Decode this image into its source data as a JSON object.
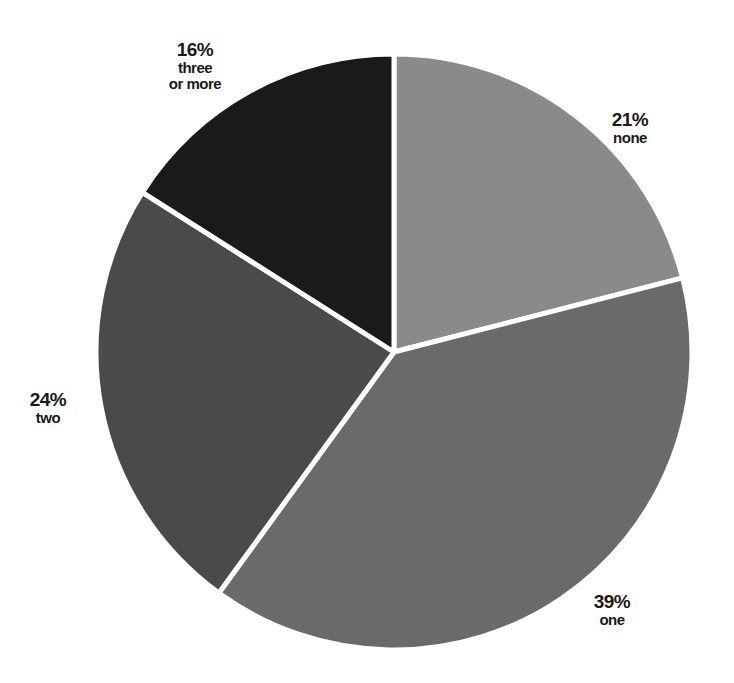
{
  "chart_data": {
    "type": "pie",
    "title": "",
    "categories": [
      "none",
      "one",
      "two",
      "three or more"
    ],
    "values": [
      21,
      39,
      24,
      16
    ],
    "value_labels": [
      "21%",
      "39%",
      "24%",
      "16%"
    ],
    "colors": [
      "#8a8a8a",
      "#6a6a6a",
      "#4a4a4a",
      "#1a1a1a"
    ],
    "start_angle_deg": 0,
    "direction": "clockwise",
    "legend": "none (direct labels)",
    "separator_color": "#ffffff"
  },
  "labels": [
    {
      "pct": "21%",
      "cat": "none",
      "x": 630,
      "y": 110
    },
    {
      "pct": "39%",
      "cat": "one",
      "x": 612,
      "y": 592
    },
    {
      "pct": "24%",
      "cat": "two",
      "x": 48,
      "y": 390
    },
    {
      "pct": "16%",
      "cat": "three or more",
      "x": 195,
      "y": 40
    }
  ]
}
